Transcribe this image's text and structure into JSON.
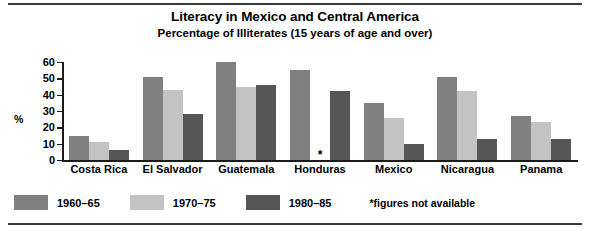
{
  "chart_data": {
    "type": "bar",
    "title": "Literacy in Mexico and Central America",
    "subtitle": "Percentage of Illiterates (15 years of age and over)",
    "xlabel": "",
    "ylabel": "%",
    "ylim": [
      0,
      60
    ],
    "yticks": [
      0,
      10,
      20,
      30,
      40,
      50,
      60
    ],
    "grid": false,
    "legend_position": "bottom-left",
    "categories": [
      "Costa Rica",
      "El Salvador",
      "Guatemala",
      "Honduras",
      "Mexico",
      "Nicaragua",
      "Panama"
    ],
    "series": [
      {
        "name": "1960–65",
        "color": "#808080",
        "values": [
          15,
          51,
          60,
          55,
          35,
          51,
          27
        ]
      },
      {
        "name": "1970–75",
        "color": "#c3c3c3",
        "values": [
          11,
          43,
          45,
          null,
          26,
          42,
          23
        ]
      },
      {
        "name": "1980–85",
        "color": "#565656",
        "values": [
          6,
          28,
          46,
          42,
          10,
          13,
          13
        ]
      }
    ],
    "annotations": [
      {
        "text": "*",
        "category": "Honduras",
        "series": "1970–75",
        "note": "figures not available"
      }
    ],
    "footnote": "*figures not available"
  },
  "colors": {
    "series_1960_65": "#808080",
    "series_1970_75": "#c3c3c3",
    "series_1980_85": "#565656",
    "axis": "#1a1a1a",
    "rule": "#3a3a3a",
    "background": "#ffffff"
  }
}
